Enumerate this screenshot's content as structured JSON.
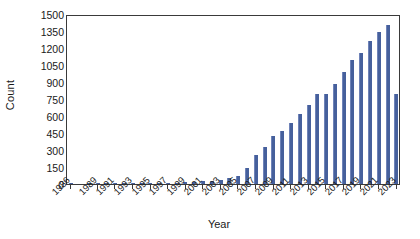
{
  "chart_data": {
    "type": "bar",
    "title": "",
    "xlabel": "Year",
    "ylabel": "Count",
    "ylim": [
      0,
      1500
    ],
    "ytick_step": 150,
    "yticks": [
      0,
      150,
      300,
      450,
      600,
      750,
      900,
      1050,
      1200,
      1350,
      1500
    ],
    "ytick_labels": [
      "0",
      "150",
      "300",
      "450",
      "600",
      "750",
      "900",
      "1050",
      "1200",
      "1350",
      "1500"
    ],
    "xtick_labels": [
      "1986",
      "1989",
      "1991",
      "1993",
      "1995",
      "1997",
      "1999",
      "2001",
      "2003",
      "2005",
      "2007",
      "2009",
      "2011",
      "2013",
      "2015",
      "2017",
      "2019",
      "2021",
      "2023"
    ],
    "grid": false,
    "legend": false,
    "bar_color": "#46609c",
    "bar_edge_color": "#6f83b8",
    "frame_color": "#3a3a3a",
    "categories": [
      "1986",
      "1987",
      "1988",
      "1989",
      "1990",
      "1991",
      "1992",
      "1993",
      "1994",
      "1995",
      "1996",
      "1997",
      "1998",
      "1999",
      "2000",
      "2001",
      "2002",
      "2003",
      "2004",
      "2005",
      "2006",
      "2007",
      "2008",
      "2009",
      "2010",
      "2011",
      "2012",
      "2013",
      "2014",
      "2015",
      "2016",
      "2017",
      "2018",
      "2019",
      "2020",
      "2021",
      "2022",
      "2023"
    ],
    "values": [
      1,
      0,
      1,
      1,
      2,
      2,
      3,
      4,
      5,
      6,
      7,
      9,
      11,
      14,
      18,
      24,
      30,
      38,
      52,
      72,
      140,
      260,
      330,
      420,
      470,
      540,
      620,
      700,
      790,
      790,
      880,
      990,
      1090,
      1160,
      1260,
      1340,
      1400,
      790
    ]
  }
}
